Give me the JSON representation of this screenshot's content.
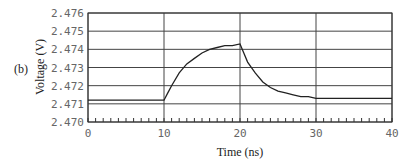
{
  "chart_data": {
    "type": "line",
    "panel_label": "(b)",
    "title": "",
    "xlabel": "Time (ns)",
    "ylabel": "Voltage (V)",
    "xlim": [
      0,
      40
    ],
    "ylim": [
      2.47,
      2.476
    ],
    "x_ticks": [
      0,
      10,
      20,
      30,
      40
    ],
    "x_tick_labels": [
      "0",
      "10",
      "20",
      "30",
      "40"
    ],
    "x_minor_step": 1,
    "y_ticks": [
      2.47,
      2.471,
      2.472,
      2.473,
      2.474,
      2.475,
      2.476
    ],
    "y_tick_labels": [
      "2.470",
      "2.471",
      "2.472",
      "2.473",
      "2.474",
      "2.475",
      "2.476"
    ],
    "grid": true,
    "legend": "none",
    "series": [
      {
        "name": "Voltage",
        "color": "#222222",
        "x": [
          0,
          5,
          10,
          10.5,
          11,
          12,
          13,
          14,
          15,
          16,
          17,
          18,
          19,
          20,
          20.5,
          21,
          22,
          23,
          24,
          25,
          26,
          27,
          28,
          29,
          30,
          32,
          34,
          36,
          38,
          40
        ],
        "y": [
          2.4712,
          2.4712,
          2.4712,
          2.4716,
          2.472,
          2.4727,
          2.4732,
          2.4735,
          2.4738,
          2.474,
          2.4741,
          2.4742,
          2.4742,
          2.4743,
          2.4738,
          2.4733,
          2.4727,
          2.4722,
          2.4719,
          2.4717,
          2.4716,
          2.4715,
          2.4714,
          2.4714,
          2.4713,
          2.4713,
          2.4713,
          2.4713,
          2.4713,
          2.4713
        ]
      }
    ]
  }
}
